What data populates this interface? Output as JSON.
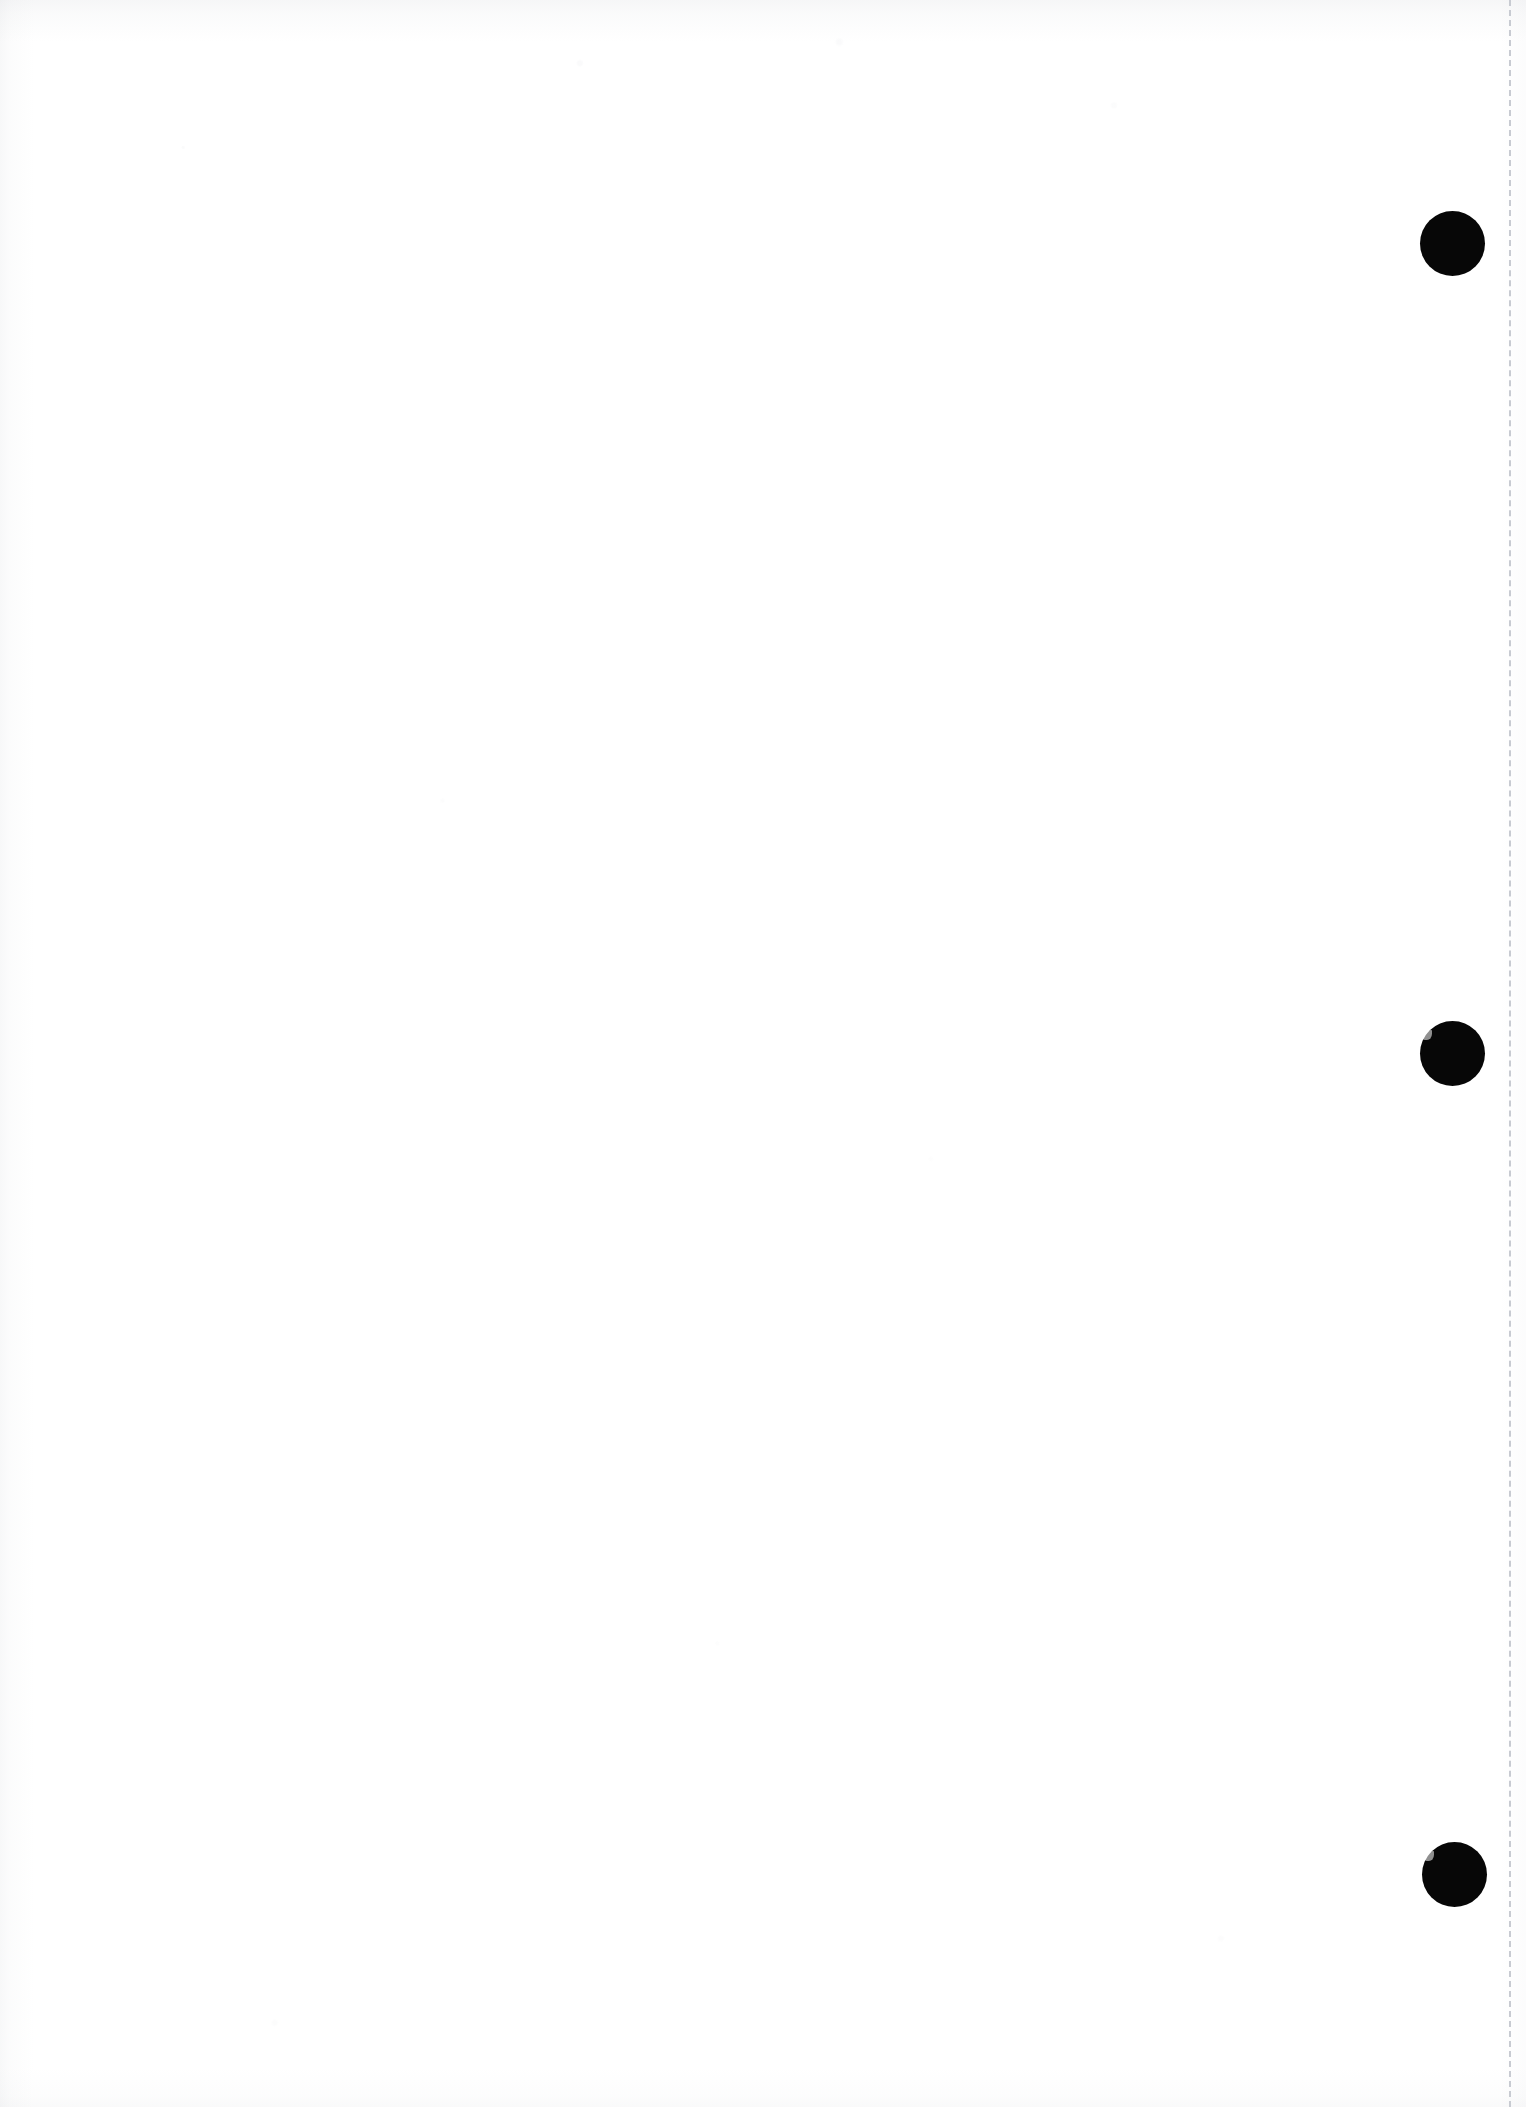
{
  "page": {
    "kind": "scanned-blank-page",
    "width": 1526,
    "height": 2107,
    "background_color": "#ffffff",
    "body_text": "",
    "caption": ""
  },
  "margin_rule": {
    "name": "vertical-dashed-margin-line",
    "color": "#c8cbd2",
    "x": 1509,
    "thickness": 2,
    "dash_length": 18,
    "gap_length": 7,
    "orientation": "vertical",
    "top": 0,
    "bottom": 2107
  },
  "markers": {
    "color": "#070707",
    "shape": "filled-circle",
    "count": 3,
    "items": [
      {
        "label": "marker-1",
        "cx": 1452,
        "cy": 243,
        "diameter": 65,
        "nicked": false
      },
      {
        "label": "marker-2",
        "cx": 1452,
        "cy": 1053,
        "diameter": 65,
        "nicked": true
      },
      {
        "label": "marker-3",
        "cx": 1454,
        "cy": 1874,
        "diameter": 65,
        "nicked": true
      }
    ]
  },
  "scan_artifacts": {
    "edge_shading_color": "#969bA5",
    "top_edge_noise": true,
    "left_edge_noise": true,
    "bottom_edge_noise": true,
    "speckle": true
  }
}
